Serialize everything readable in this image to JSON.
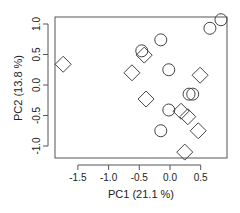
{
  "chart_data": {
    "type": "scatter",
    "title": "",
    "xlabel": "PC1 (21.1 %)",
    "ylabel": "PC2 (13.8 %)",
    "xlim": [
      -1.88,
      0.93
    ],
    "ylim": [
      -1.2,
      1.12
    ],
    "xticks": [
      -1.5,
      -1.0,
      -0.5,
      0.0,
      0.5
    ],
    "xtick_labels": [
      "-1.5",
      "-1.0",
      "-0.5",
      "0.0",
      "0.5"
    ],
    "yticks": [
      -1.0,
      -0.5,
      0.0,
      0.5,
      1.0
    ],
    "ytick_labels": [
      "-1.0",
      "-0.5",
      "0.0",
      "0.5",
      "1.0"
    ],
    "grid": false,
    "legend": null,
    "series": [
      {
        "name": "circle",
        "marker": "circle",
        "color": "#444444",
        "points": [
          {
            "x": -0.15,
            "y": 0.74
          },
          {
            "x": -0.46,
            "y": 0.56
          },
          {
            "x": -0.02,
            "y": 0.25
          },
          {
            "x": 0.65,
            "y": 0.93
          },
          {
            "x": 0.83,
            "y": 1.07
          },
          {
            "x": 0.31,
            "y": -0.15
          },
          {
            "x": 0.37,
            "y": -0.15
          },
          {
            "x": -0.02,
            "y": -0.41
          },
          {
            "x": -0.15,
            "y": -0.75
          }
        ]
      },
      {
        "name": "diamond",
        "marker": "diamond",
        "color": "#444444",
        "points": [
          {
            "x": -1.74,
            "y": 0.34
          },
          {
            "x": -0.42,
            "y": 0.49
          },
          {
            "x": -0.62,
            "y": 0.2
          },
          {
            "x": 0.49,
            "y": 0.16
          },
          {
            "x": -0.39,
            "y": -0.23
          },
          {
            "x": 0.18,
            "y": -0.43
          },
          {
            "x": 0.29,
            "y": -0.52
          },
          {
            "x": 0.46,
            "y": -0.75
          },
          {
            "x": 0.24,
            "y": -1.1
          }
        ]
      }
    ]
  }
}
